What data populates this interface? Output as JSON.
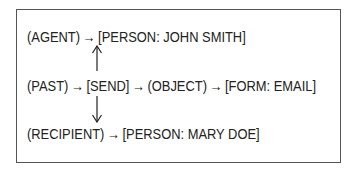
{
  "diagram": {
    "type": "conceptual-graph",
    "border_color": "#555555",
    "text_color": "#222222",
    "rows": [
      {
        "id": "agent-row",
        "relation": "(AGENT)",
        "arrow": "→",
        "concept": "[PERSON: JOHN SMITH]"
      },
      {
        "id": "main-row",
        "modifier": "(PAST)",
        "arrow1": "→",
        "verb": "[SEND]",
        "arrow2": "→",
        "relation": "(OBJECT)",
        "arrow3": "→",
        "concept": "[FORM: EMAIL]"
      },
      {
        "id": "recipient-row",
        "relation": "(RECIPIENT)",
        "arrow": "→",
        "concept": "[PERSON: MARY DOE]"
      }
    ],
    "vertical_links": [
      {
        "from": "[SEND]",
        "to": "(AGENT) row",
        "direction": "up"
      },
      {
        "from": "[SEND]",
        "to": "(RECIPIENT) row",
        "direction": "down"
      }
    ]
  }
}
